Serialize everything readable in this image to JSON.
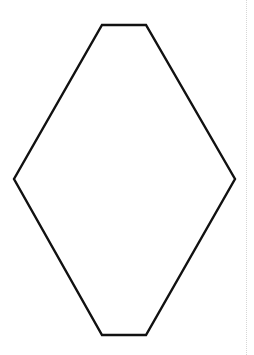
{
  "puzzle": {
    "type": "triangular-grid number puzzle",
    "colors": {
      "border": "#111111",
      "grid": "#c4c4c4",
      "node": "#a9a9a9",
      "clue": "#111111"
    },
    "rows_of_nodes": [
      1,
      2,
      3,
      4,
      3,
      2,
      1
    ],
    "clues": [
      {
        "label": "3",
        "cell": "top-row-up"
      },
      {
        "label": "2",
        "cell": "top-row-left"
      },
      {
        "label": "6",
        "cell": "row2-left"
      },
      {
        "label": "4",
        "cell": "row2-right"
      },
      {
        "label": "2",
        "cell": "row2-far-right"
      },
      {
        "label": "4",
        "cell": "row3-left"
      },
      {
        "label": "6",
        "cell": "row3-right"
      },
      {
        "label": "4",
        "cell": "row4-far-left"
      },
      {
        "label": "7",
        "cell": "row4-left"
      },
      {
        "label": "6",
        "cell": "row4-center-left"
      },
      {
        "label": "2",
        "cell": "row4-center-right"
      },
      {
        "label": "9",
        "cell": "row4-right"
      },
      {
        "label": "5",
        "cell": "row5-left"
      },
      {
        "label": "1",
        "cell": "row5-center-left"
      },
      {
        "label": "4",
        "cell": "row5-center"
      },
      {
        "label": "4",
        "cell": "row5-right"
      },
      {
        "label": "6",
        "cell": "row5-far-right"
      }
    ]
  }
}
